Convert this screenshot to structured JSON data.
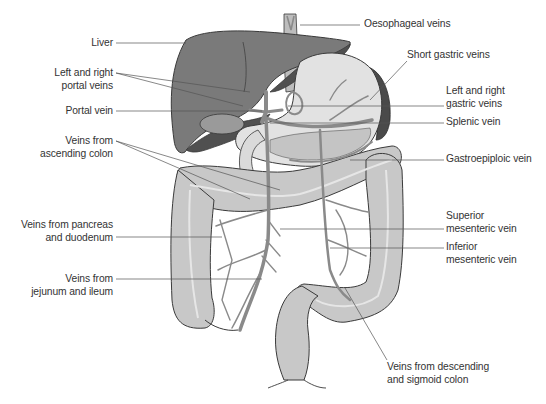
{
  "diagram": {
    "colors": {
      "liver": "#7a7a7a",
      "liver_dark": "#505050",
      "stomach": "#e2e2e2",
      "spleen": "#4a4a4a",
      "intestine": "#c8c8c8",
      "vein": "#8a8a8a",
      "outline": "#3a3a3a",
      "leader_line": "#555555",
      "text": "#333333"
    },
    "labels_left": [
      {
        "id": "liver",
        "lines": [
          "Liver"
        ]
      },
      {
        "id": "left-right-portal-veins",
        "lines": [
          "Left and right",
          "portal veins"
        ]
      },
      {
        "id": "portal-vein",
        "lines": [
          "Portal vein"
        ]
      },
      {
        "id": "veins-ascending-colon",
        "lines": [
          "Veins from",
          "ascending colon"
        ]
      },
      {
        "id": "veins-pancreas-duodenum",
        "lines": [
          "Veins from pancreas",
          "and duodenum"
        ]
      },
      {
        "id": "veins-jejunum-ileum",
        "lines": [
          "Veins from",
          "jejunum and ileum"
        ]
      }
    ],
    "labels_right": [
      {
        "id": "oesophageal-veins",
        "lines": [
          "Oesophageal veins"
        ]
      },
      {
        "id": "short-gastric-veins",
        "lines": [
          "Short gastric veins"
        ]
      },
      {
        "id": "left-right-gastric-veins",
        "lines": [
          "Left and right",
          "gastric veins"
        ]
      },
      {
        "id": "splenic-vein",
        "lines": [
          "Splenic vein"
        ]
      },
      {
        "id": "gastroepiploic-vein",
        "lines": [
          "Gastroepiploic vein"
        ]
      },
      {
        "id": "superior-mesenteric-vein",
        "lines": [
          "Superior",
          "mesenteric vein"
        ]
      },
      {
        "id": "inferior-mesenteric-vein",
        "lines": [
          "Inferior",
          "mesenteric vein"
        ]
      },
      {
        "id": "veins-descending-sigmoid-colon",
        "lines": [
          "Veins from descending",
          "and sigmoid colon"
        ]
      }
    ]
  }
}
